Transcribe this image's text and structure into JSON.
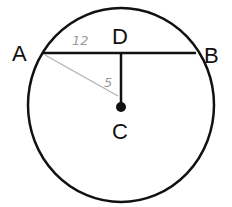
{
  "diagram": {
    "type": "circle-chord",
    "colors": {
      "ink": "#111111",
      "pencil": "#a8a8a8",
      "background": "#ffffff"
    },
    "points": {
      "A": {
        "label": "A"
      },
      "B": {
        "label": "B"
      },
      "C": {
        "label": "C",
        "role": "center"
      },
      "D": {
        "label": "D",
        "role": "midpoint of chord AB"
      }
    },
    "segments": [
      {
        "from": "A",
        "to": "B",
        "style": "solid"
      },
      {
        "from": "D",
        "to": "C",
        "style": "solid"
      },
      {
        "from": "A",
        "to": "C",
        "style": "pencil"
      }
    ],
    "annotations": {
      "AD": "12",
      "DC": "5"
    }
  }
}
